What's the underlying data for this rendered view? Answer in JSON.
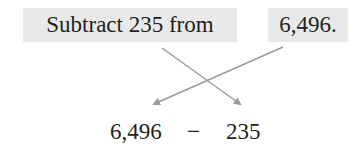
{
  "statement": {
    "phrase": "Subtract 235 from",
    "number": "6,496."
  },
  "expression": {
    "minuend": "6,496",
    "operator": "−",
    "subtrahend": "235"
  },
  "arrows": {
    "color": "#9a9a9a",
    "items": [
      {
        "from": "phrase (235)",
        "to": "subtrahend"
      },
      {
        "from": "number (6,496)",
        "to": "minuend"
      }
    ]
  },
  "colors": {
    "box_background": "#e9e9e9",
    "text": "#231f20"
  }
}
